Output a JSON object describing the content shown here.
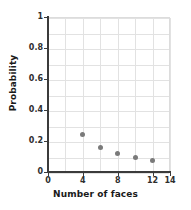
{
  "chart_data": {
    "type": "scatter",
    "title": "",
    "xlabel": "Number of faces",
    "ylabel": "Probability",
    "xlim": [
      0,
      14
    ],
    "ylim": [
      0,
      1
    ],
    "x_ticks": [
      0,
      4,
      8,
      12,
      14
    ],
    "x_tick_labels": [
      "0",
      "4",
      "8",
      "12",
      "14"
    ],
    "y_ticks": [
      0,
      0.2,
      0.4,
      0.6,
      0.8,
      1
    ],
    "y_tick_labels": [
      "0",
      "0.2",
      "0.4",
      "0.6",
      "0.8",
      "1"
    ],
    "grid": true,
    "grid_x_minor_step": 2,
    "grid_y_minor_step": 0.1,
    "legend": null,
    "marker_color": "#7a7a7a",
    "x": [
      4,
      6,
      8,
      10,
      12
    ],
    "values": [
      0.25,
      0.167,
      0.125,
      0.1,
      0.083
    ],
    "points": [
      {
        "x": 4,
        "y": 0.25
      },
      {
        "x": 6,
        "y": 0.167
      },
      {
        "x": 8,
        "y": 0.125
      },
      {
        "x": 10,
        "y": 0.1
      },
      {
        "x": 12,
        "y": 0.083
      }
    ]
  },
  "axis_color": "#3b3b3b",
  "grid_color": "#e2e2e2"
}
